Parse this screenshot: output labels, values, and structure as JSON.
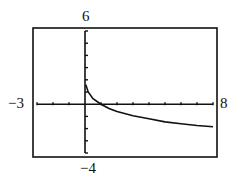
{
  "chart_data": {
    "type": "line",
    "title": "",
    "xlabel": "",
    "ylabel": "",
    "xlim": [
      -3,
      8
    ],
    "ylim": [
      -4,
      6
    ],
    "x_tick_step": 1,
    "y_tick_step": 1,
    "grid": false,
    "window_labels": {
      "xmin": "−3",
      "xmax": "8",
      "ymin": "−4",
      "ymax": "6"
    },
    "series": [
      {
        "name": "f(x)",
        "x": [
          0.05,
          0.2,
          0.5,
          1,
          1.5,
          2,
          3,
          4,
          5,
          6,
          7,
          8
        ],
        "y": [
          1.6,
          1.0,
          0.45,
          0.0,
          -0.35,
          -0.6,
          -0.95,
          -1.2,
          -1.45,
          -1.6,
          -1.75,
          -1.85
        ]
      }
    ]
  }
}
